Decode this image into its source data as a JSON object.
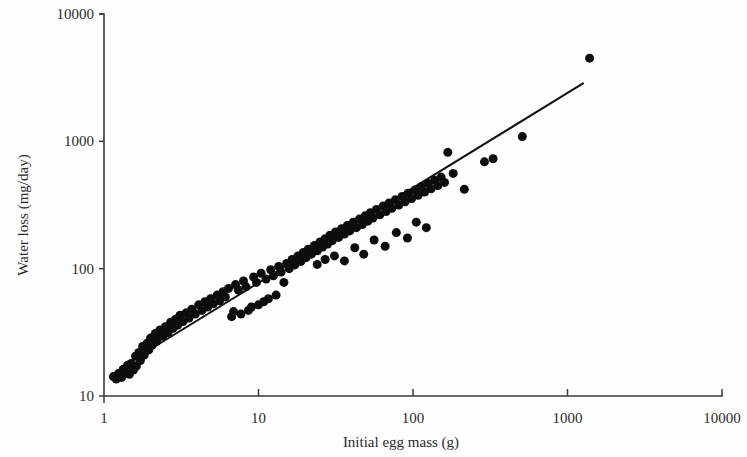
{
  "figure": {
    "background_color": "#fefefe",
    "foreground_color": "#1a1a1a"
  },
  "chart_data": {
    "type": "scatter",
    "title": "",
    "subtitle": "",
    "xlabel": "Initial egg mass (g)",
    "ylabel": "Water loss (mg/day)",
    "xscale": "log",
    "yscale": "log",
    "xlim": [
      1,
      10000
    ],
    "ylim": [
      10,
      10000
    ],
    "xticks": [
      1,
      10,
      100,
      1000,
      10000
    ],
    "xtick_labels": [
      "1",
      "10",
      "100",
      "1000",
      "10000"
    ],
    "yticks": [
      10,
      100,
      1000,
      10000
    ],
    "ytick_labels": [
      "10",
      "100",
      "1000",
      "10000"
    ],
    "grid": false,
    "legend": null,
    "legend_position": "none",
    "spines": [
      "left",
      "bottom"
    ],
    "marker": "filled-circle",
    "marker_color": "#0d0d0d",
    "marker_size_px": 9,
    "annotations": [],
    "fit_line": {
      "label": "",
      "color": "#101010",
      "x_start": 1.37,
      "y_start": 17.6,
      "x_end": 1260,
      "y_end": 2850
    },
    "n_points": 141,
    "points": [
      [
        1.15,
        14.2
      ],
      [
        1.2,
        13.6
      ],
      [
        1.24,
        15.0
      ],
      [
        1.3,
        14.0
      ],
      [
        1.33,
        16.2
      ],
      [
        1.38,
        15.2
      ],
      [
        1.42,
        17.4
      ],
      [
        1.46,
        14.8
      ],
      [
        1.5,
        18.0
      ],
      [
        1.55,
        16.0
      ],
      [
        1.6,
        20.5
      ],
      [
        1.62,
        17.2
      ],
      [
        1.68,
        22.0
      ],
      [
        1.72,
        19.0
      ],
      [
        1.78,
        24.5
      ],
      [
        1.82,
        21.0
      ],
      [
        1.9,
        26.0
      ],
      [
        1.95,
        23.0
      ],
      [
        2.0,
        28.5
      ],
      [
        2.05,
        25.0
      ],
      [
        2.15,
        31.0
      ],
      [
        2.2,
        27.0
      ],
      [
        2.3,
        33.0
      ],
      [
        2.4,
        29.5
      ],
      [
        2.5,
        35.0
      ],
      [
        2.6,
        31.5
      ],
      [
        2.7,
        38.0
      ],
      [
        2.8,
        34.0
      ],
      [
        2.9,
        40.0
      ],
      [
        3.0,
        36.0
      ],
      [
        3.1,
        43.0
      ],
      [
        3.25,
        38.5
      ],
      [
        3.4,
        45.0
      ],
      [
        3.55,
        41.0
      ],
      [
        3.7,
        48.0
      ],
      [
        3.9,
        44.0
      ],
      [
        4.1,
        52.0
      ],
      [
        4.3,
        47.0
      ],
      [
        4.5,
        55.0
      ],
      [
        4.7,
        50.0
      ],
      [
        4.9,
        58.0
      ],
      [
        5.1,
        53.0
      ],
      [
        5.4,
        62.0
      ],
      [
        5.6,
        56.0
      ],
      [
        5.9,
        66.0
      ],
      [
        6.1,
        60.0
      ],
      [
        6.4,
        70.0
      ],
      [
        6.7,
        42.0
      ],
      [
        6.9,
        46.0
      ],
      [
        7.1,
        75.0
      ],
      [
        7.4,
        68.0
      ],
      [
        7.7,
        44.0
      ],
      [
        8.0,
        80.0
      ],
      [
        8.3,
        72.0
      ],
      [
        8.6,
        47.0
      ],
      [
        9.0,
        50.0
      ],
      [
        9.3,
        86.0
      ],
      [
        9.7,
        78.0
      ],
      [
        10.0,
        52.0
      ],
      [
        10.4,
        92.0
      ],
      [
        10.8,
        55.0
      ],
      [
        11.2,
        83.0
      ],
      [
        11.6,
        58.0
      ],
      [
        12.0,
        98.0
      ],
      [
        12.5,
        88.0
      ],
      [
        13.0,
        62.0
      ],
      [
        13.5,
        104.0
      ],
      [
        14.0,
        94.0
      ],
      [
        14.6,
        78.0
      ],
      [
        15.2,
        110.0
      ],
      [
        15.8,
        100.0
      ],
      [
        16.5,
        118.0
      ],
      [
        17.2,
        107.0
      ],
      [
        18.0,
        126.0
      ],
      [
        18.8,
        114.0
      ],
      [
        19.5,
        134.0
      ],
      [
        20.3,
        122.0
      ],
      [
        21.0,
        142.0
      ],
      [
        22.0,
        130.0
      ],
      [
        23.0,
        152.0
      ],
      [
        24.0,
        138.0
      ],
      [
        25.0,
        162.0
      ],
      [
        26.0,
        148.0
      ],
      [
        27.0,
        172.0
      ],
      [
        28.0,
        156.0
      ],
      [
        29.0,
        183.0
      ],
      [
        30.0,
        166.0
      ],
      [
        31.5,
        194.0
      ],
      [
        33.0,
        176.0
      ],
      [
        34.5,
        206.0
      ],
      [
        36.0,
        187.0
      ],
      [
        37.5,
        218.0
      ],
      [
        39.0,
        198.0
      ],
      [
        41.0,
        231.0
      ],
      [
        43.0,
        210.0
      ],
      [
        45.0,
        245.0
      ],
      [
        47.0,
        222.0
      ],
      [
        49.0,
        260.0
      ],
      [
        51.0,
        236.0
      ],
      [
        53.0,
        275.0
      ],
      [
        55.0,
        250.0
      ],
      [
        58.0,
        292.0
      ],
      [
        61.0,
        265.0
      ],
      [
        64.0,
        310.0
      ],
      [
        67.0,
        281.0
      ],
      [
        70.0,
        328.0
      ],
      [
        73.0,
        298.0
      ],
      [
        77.0,
        348.0
      ],
      [
        81.0,
        316.0
      ],
      [
        85.0,
        369.0
      ],
      [
        89.0,
        335.0
      ],
      [
        93.0,
        391.0
      ],
      [
        98.0,
        355.0
      ],
      [
        103.0,
        415.0
      ],
      [
        108.0,
        377.0
      ],
      [
        113.0,
        440.0
      ],
      [
        119.0,
        400.0
      ],
      [
        125.0,
        466.0
      ],
      [
        131.0,
        424.0
      ],
      [
        138.0,
        494.0
      ],
      [
        145.0,
        449.0
      ],
      [
        152.0,
        524.0
      ],
      [
        160.0,
        476.0
      ],
      [
        24.0,
        108.0
      ],
      [
        27.0,
        118.0
      ],
      [
        31.0,
        126.0
      ],
      [
        36.0,
        115.0
      ],
      [
        42.0,
        146.0
      ],
      [
        48.0,
        130.0
      ],
      [
        56.0,
        168.0
      ],
      [
        66.0,
        150.0
      ],
      [
        78.0,
        192.0
      ],
      [
        92.0,
        174.0
      ],
      [
        105.0,
        232.0
      ],
      [
        122.0,
        210.0
      ],
      [
        168.0,
        820.0
      ],
      [
        182.0,
        560.0
      ],
      [
        215.0,
        420.0
      ],
      [
        290.0,
        690.0
      ],
      [
        330.0,
        730.0
      ],
      [
        510.0,
        1090.0
      ],
      [
        1390.0,
        4500.0
      ]
    ]
  },
  "axis_geometry": {
    "left_px": 104,
    "right_px": 722,
    "top_px": 14,
    "bottom_px": 396
  }
}
